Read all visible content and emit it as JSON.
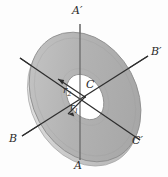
{
  "figure": {
    "type": "physics-diagram",
    "background_color": "#fdfdfd",
    "labels": {
      "axis_a_top": "A′",
      "axis_a_bottom": "A",
      "axis_b_right": "B′",
      "axis_b_left": "B",
      "axis_c_right": "C′",
      "axis_c_left": "C",
      "center_point": "C",
      "inner_radius": "r",
      "inner_radius_sub": "1",
      "outer_radius": "r",
      "outer_radius_sub": "2"
    },
    "colors": {
      "disk_face": "#aeaeae",
      "disk_face_light": "#c4c4c4",
      "disk_rim": "#d4d4d4",
      "disk_rim_highlight": "#e6e6e6",
      "disk_outline": "#8b8b8b",
      "hole_fill": "#ffffff",
      "axis_line": "#2e2e2e",
      "vertical_axis_line": "#6a6a6a",
      "label_text": "#2b2b2b"
    },
    "geometry": {
      "center_x": 85,
      "center_y": 97,
      "outer_rx": 52,
      "outer_ry": 68,
      "inner_rx": 17,
      "inner_ry": 24,
      "tilt_degrees": -28,
      "vertical_axis_x": 80,
      "vertical_axis_top_y": 24,
      "vertical_axis_bottom_y": 160
    }
  }
}
